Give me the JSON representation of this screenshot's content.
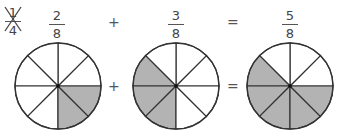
{
  "top_row": {
    "crossed_fraction": {
      "numerator": "1",
      "denominator": "4"
    },
    "fraction1": {
      "numerator": "2",
      "denominator": "8"
    },
    "op1": "+",
    "fraction2": {
      "numerator": "3",
      "denominator": "8"
    },
    "op2": "=",
    "result": {
      "numerator": "5",
      "denominator": "8"
    }
  },
  "middle_row": {
    "op1": "+",
    "op2": "="
  },
  "circles": [
    {
      "label": "2/8",
      "sectors": 8,
      "shaded": [
        6,
        7
      ]
    },
    {
      "label": "3/8",
      "sectors": 8,
      "shaded": [
        3,
        4,
        5
      ]
    },
    {
      "label": "5/8",
      "sectors": 8,
      "shaded": [
        3,
        4,
        5,
        6,
        7
      ]
    }
  ],
  "colors": {
    "shade": "#b3b3b3",
    "line": "#333333",
    "fill": "#ffffff"
  }
}
